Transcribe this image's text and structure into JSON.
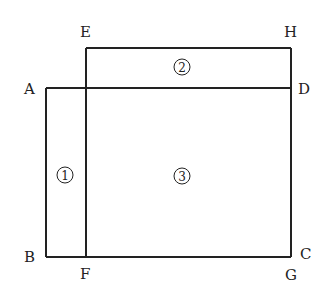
{
  "diagram": {
    "points": {
      "A": {
        "label": "A"
      },
      "B": {
        "label": "B"
      },
      "C": {
        "label": "C"
      },
      "D": {
        "label": "D"
      },
      "E": {
        "label": "E"
      },
      "F": {
        "label": "F"
      },
      "G": {
        "label": "G"
      },
      "H": {
        "label": "H"
      }
    },
    "regions": [
      {
        "id": "1",
        "label": "1"
      },
      {
        "id": "2",
        "label": "2"
      },
      {
        "id": "3",
        "label": "3"
      }
    ],
    "line_color": "#222222"
  }
}
